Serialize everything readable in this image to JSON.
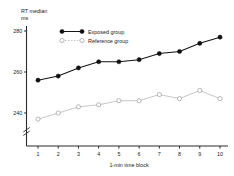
{
  "chart_data": {
    "type": "line",
    "title": "",
    "ylabel_line1": "RT median",
    "ylabel_line2": "ms",
    "xlabel": "1-min  time block",
    "categories": [
      1,
      2,
      3,
      4,
      5,
      6,
      7,
      8,
      9,
      10
    ],
    "x_tick_labels": [
      "1",
      "2",
      "3",
      "4",
      "5",
      "6",
      "7",
      "8",
      "9",
      "10"
    ],
    "y_tick_labels": [
      "280",
      "260",
      "240"
    ],
    "y_ticks": [
      280,
      260,
      240
    ],
    "ylim": [
      232,
      284
    ],
    "xlim": [
      0.5,
      10.5
    ],
    "grid": false,
    "axis_break": true,
    "legend_position": "top-left-inside",
    "series": [
      {
        "name": "Exposed group",
        "marker": "filled-circle",
        "color": "#101010",
        "values": [
          256,
          258,
          262,
          265,
          265,
          266,
          269,
          270,
          274,
          277
        ]
      },
      {
        "name": "Reference group",
        "marker": "open-circle",
        "color": "#b4b4b4",
        "values": [
          237,
          240,
          243,
          244,
          246,
          246,
          249,
          247,
          251,
          247
        ]
      }
    ]
  },
  "legend": {
    "items": [
      {
        "label": "Exposed group"
      },
      {
        "label": "Reference group"
      }
    ]
  }
}
